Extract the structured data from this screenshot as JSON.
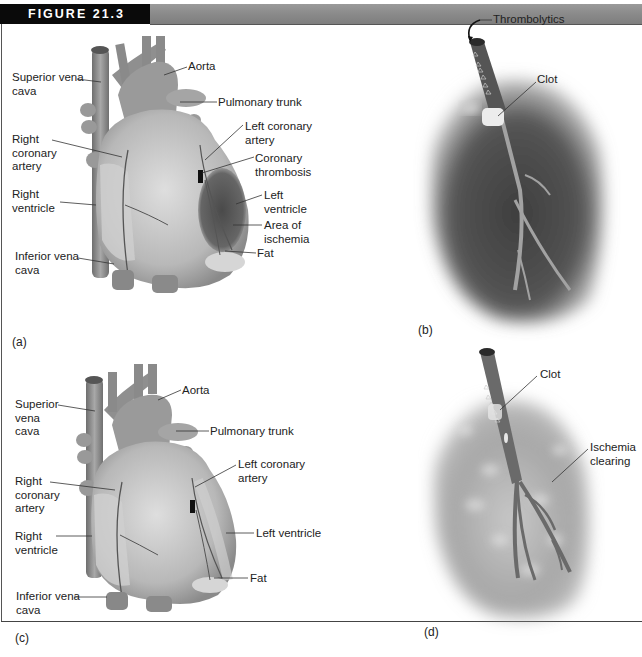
{
  "figure": {
    "label": "FIGURE 21.3",
    "header_bar_color": "#8a8a8a",
    "header_label_bg": "#0a0a0a"
  },
  "panels": {
    "a": {
      "letter": "(a)",
      "labels": {
        "superior_vena_cava": "Superior vena\ncava",
        "aorta": "Aorta",
        "pulmonary_trunk": "Pulmonary trunk",
        "right_coronary_artery": "Right\ncoronary\nartery",
        "left_coronary_artery": "Left coronary\nartery",
        "coronary_thrombosis": "Coronary\nthrombosis",
        "right_ventricle": "Right\nventricle",
        "left_ventricle": "Left\nventricle",
        "area_of_ischemia": "Area of\nischemia",
        "inferior_vena_cava": "Inferior vena\ncava",
        "fat": "Fat"
      }
    },
    "b": {
      "letter": "(b)",
      "labels": {
        "thrombolytics": "Thrombolytics",
        "clot": "Clot"
      }
    },
    "c": {
      "letter": "(c)",
      "labels": {
        "superior_vena_cava": "Superior\nvena\ncava",
        "aorta": "Aorta",
        "pulmonary_trunk": "Pulmonary trunk",
        "right_coronary_artery": "Right\ncoronary\nartery",
        "left_coronary_artery": "Left coronary\nartery",
        "right_ventricle": "Right\nventricle",
        "left_ventricle": "Left ventricle",
        "inferior_vena_cava": "Inferior vena\ncava",
        "fat": "Fat"
      }
    },
    "d": {
      "letter": "(d)",
      "labels": {
        "clot": "Clot",
        "ischemia_clearing": "Ischemia\nclearing"
      }
    }
  },
  "colors": {
    "tissue_light": "#d4d4d4",
    "tissue_mid": "#9e9e9e",
    "tissue_dark": "#555555",
    "ischemia": "#5a5a5a",
    "vessel": "#7a7a7a",
    "leader_line": "#333333"
  },
  "footer": {
    "cutoff_text": "(b) a                    ...      d"
  }
}
